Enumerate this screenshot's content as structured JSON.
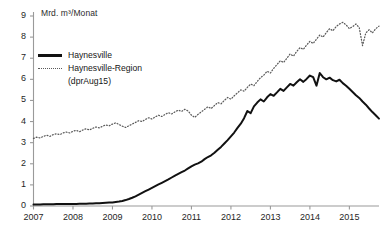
{
  "chart_data": {
    "type": "line",
    "title": "",
    "subtitle": "",
    "ylabel": "Mrd. m³/Monat",
    "xlabel": "",
    "ylim": [
      0,
      9
    ],
    "xlim": [
      2007,
      2015.75
    ],
    "yticks": [
      "0",
      "1",
      "2",
      "3",
      "4",
      "5",
      "6",
      "7",
      "8",
      "9"
    ],
    "xticks": [
      "2007",
      "2008",
      "2009",
      "2010",
      "2011",
      "2012",
      "2013",
      "2014",
      "2015"
    ],
    "grid": false,
    "legend_position": "upper-left",
    "colors": {
      "solid": "#111111",
      "dotted": "#5a5a5a",
      "axis": "#9a9a9a",
      "text": "#1f1f1f"
    },
    "series": [
      {
        "name": "Haynesville",
        "style": "solid",
        "x_start": 2007.0,
        "x_step": 0.08333,
        "values": [
          0.07,
          0.07,
          0.07,
          0.08,
          0.08,
          0.08,
          0.08,
          0.09,
          0.09,
          0.09,
          0.09,
          0.1,
          0.1,
          0.1,
          0.11,
          0.11,
          0.11,
          0.12,
          0.12,
          0.13,
          0.13,
          0.14,
          0.15,
          0.16,
          0.17,
          0.19,
          0.21,
          0.24,
          0.28,
          0.33,
          0.39,
          0.46,
          0.54,
          0.62,
          0.7,
          0.78,
          0.86,
          0.94,
          1.02,
          1.1,
          1.18,
          1.26,
          1.35,
          1.44,
          1.52,
          1.6,
          1.68,
          1.78,
          1.88,
          1.96,
          2.02,
          2.1,
          2.22,
          2.32,
          2.4,
          2.52,
          2.66,
          2.8,
          2.96,
          3.12,
          3.3,
          3.48,
          3.7,
          3.9,
          4.16,
          4.5,
          4.4,
          4.72,
          4.9,
          5.05,
          4.95,
          5.15,
          5.3,
          5.22,
          5.38,
          5.55,
          5.45,
          5.62,
          5.78,
          5.7,
          5.86,
          6.0,
          5.88,
          6.02,
          6.18,
          6.1,
          5.7,
          6.3,
          6.1,
          6.0,
          6.08,
          5.96,
          5.9,
          5.98,
          5.82,
          5.7,
          5.55,
          5.4,
          5.25,
          5.12,
          4.95,
          4.8,
          4.62,
          4.45,
          4.3,
          4.14,
          4.0,
          3.86,
          3.72,
          3.6,
          3.62,
          3.48,
          3.4,
          3.1,
          3.3,
          3.38,
          3.28,
          3.32,
          3.26,
          3.3,
          3.22,
          3.18,
          3.12,
          3.16,
          3.1,
          3.2,
          3.28,
          3.34,
          3.26,
          3.3,
          3.28,
          3.32,
          3.3
        ]
      },
      {
        "name": "Haynesville-Region (dprAug15)",
        "style": "dotted",
        "x_start": 2007.0,
        "x_step": 0.08333,
        "values": [
          3.2,
          3.26,
          3.22,
          3.3,
          3.35,
          3.3,
          3.38,
          3.42,
          3.38,
          3.46,
          3.5,
          3.46,
          3.54,
          3.58,
          3.52,
          3.6,
          3.66,
          3.6,
          3.68,
          3.74,
          3.7,
          3.78,
          3.84,
          3.8,
          3.88,
          3.94,
          3.86,
          3.78,
          3.72,
          3.8,
          3.88,
          3.96,
          4.04,
          4.0,
          4.1,
          4.18,
          4.12,
          4.22,
          4.3,
          4.24,
          4.34,
          4.42,
          4.36,
          4.46,
          4.54,
          4.48,
          4.58,
          4.5,
          4.3,
          4.2,
          4.34,
          4.46,
          4.58,
          4.7,
          4.62,
          4.76,
          4.9,
          4.84,
          5.0,
          5.14,
          5.06,
          5.22,
          5.36,
          5.5,
          5.44,
          5.62,
          5.78,
          5.7,
          5.9,
          6.08,
          6.2,
          6.38,
          6.3,
          6.52,
          6.7,
          6.88,
          6.8,
          7.0,
          7.2,
          7.1,
          7.32,
          7.5,
          7.42,
          7.62,
          7.8,
          7.7,
          7.9,
          8.1,
          8.0,
          8.22,
          8.4,
          8.3,
          8.5,
          8.62,
          8.7,
          8.58,
          8.4,
          8.5,
          8.62,
          8.45,
          7.6,
          8.2,
          8.35,
          8.2,
          8.4,
          8.52,
          8.4,
          8.5,
          8.3,
          8.2,
          8.05,
          7.9,
          7.7,
          7.5,
          7.3,
          7.1,
          6.9,
          6.7,
          6.5,
          6.35,
          6.2,
          6.05,
          5.9,
          6.0,
          5.8,
          5.72,
          5.85,
          5.78,
          5.9,
          5.82,
          5.95,
          5.88,
          5.8,
          5.86,
          5.95,
          6.05,
          5.95,
          5.85,
          5.9,
          5.8
        ]
      }
    ]
  },
  "axis": {
    "y_title": "Mrd. m³/Monat"
  },
  "legend": {
    "items": [
      {
        "label": "Haynesville",
        "sub": ""
      },
      {
        "label": "Haynesville-Region",
        "sub": "(dprAug15)"
      }
    ]
  }
}
